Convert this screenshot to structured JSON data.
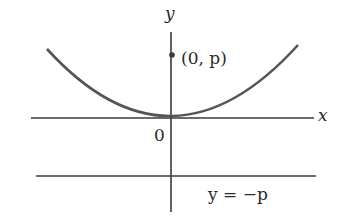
{
  "diagram": {
    "type": "parabola with focus and directrix",
    "axes": {
      "x_label": "x",
      "y_label": "y",
      "origin_label": "0"
    },
    "focus": {
      "label": "(0, p)"
    },
    "directrix": {
      "label": "y = −p"
    },
    "colors": {
      "stroke": "#3a3a3a",
      "curve": "#555555",
      "background": "#ffffff"
    }
  }
}
